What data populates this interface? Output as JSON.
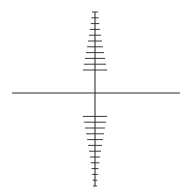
{
  "figure": {
    "type": "line-diagram",
    "background_color": "#ffffff",
    "width": 189,
    "height": 195,
    "origin": {
      "x": 95,
      "y": 93
    }
  },
  "colors": {
    "background": "#ffffff",
    "axis_stroke": "#2b2b2b",
    "tick_stroke": "#3a3a3a",
    "cube_stroke": "#111111",
    "cube_fill": "#ffffff"
  },
  "chart_data": {
    "type": "line",
    "subtitle": "",
    "xlabel": "",
    "ylabel": "",
    "grid": false,
    "legend_position": "none",
    "annotations": [],
    "axes": [
      {
        "name": "vertical-axis",
        "label": "",
        "start": {
          "x": 95,
          "y": 12
        },
        "end": {
          "x": 95,
          "y": 186
        },
        "tick_orientation": "horizontal",
        "tick_count": 30,
        "tick_scale_note": "tick half-length grows toward origin (perspective foreshortening)",
        "max_tick_half_length": 17,
        "min_tick_half_length": 2
      },
      {
        "name": "horizontal-axis",
        "label": "",
        "start": {
          "x": 12,
          "y": 93
        },
        "end": {
          "x": 180,
          "y": 93
        },
        "tick_orientation": "slanted",
        "tick_count": 30,
        "tick_slant_dx": 6,
        "tick_slant_dy": -9,
        "tick_scale_note": "tick length grows toward origin",
        "max_tick_half_length": 13,
        "min_tick_half_length": 2
      },
      {
        "name": "diagonal-axis",
        "label": "",
        "start": {
          "x": 22,
          "y": 137
        },
        "end": {
          "x": 172,
          "y": 47
        },
        "tick_orientation": "horizontal",
        "tick_count": 28,
        "tick_scale_note": "short horizontal ticks, longer near origin",
        "max_tick_half_length": 9,
        "min_tick_half_length": 2
      }
    ],
    "objects": [
      {
        "name": "cube",
        "shape": "wireframe-cube",
        "projection": "oblique/cabinet",
        "front_face": {
          "left": 80,
          "top": 76,
          "right": 116,
          "bottom": 111
        },
        "depth_offset": {
          "dx": -13,
          "dy": -10
        },
        "vertices": {
          "front_top_left": {
            "x": 80,
            "y": 76
          },
          "front_top_right": {
            "x": 116,
            "y": 76
          },
          "front_bottom_right": {
            "x": 116,
            "y": 111
          },
          "front_bottom_left": {
            "x": 80,
            "y": 111
          },
          "back_top_left": {
            "x": 67,
            "y": 66
          },
          "back_top_right": {
            "x": 103,
            "y": 66
          },
          "back_bottom_right": {
            "x": 103,
            "y": 101
          },
          "back_bottom_left": {
            "x": 67,
            "y": 101
          }
        },
        "edge_count": 12
      }
    ]
  }
}
